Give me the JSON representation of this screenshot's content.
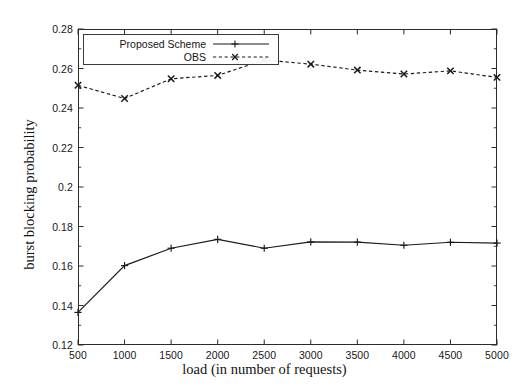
{
  "chart_data": {
    "type": "line",
    "title": "",
    "xlabel": "load (in number of requests)",
    "ylabel": "burst blocking probability",
    "x": [
      500,
      1000,
      1500,
      2000,
      2500,
      3000,
      3500,
      4000,
      4500,
      5000
    ],
    "xlim": [
      500,
      5000
    ],
    "ylim": [
      0.12,
      0.28
    ],
    "xticks": [
      "500",
      "1000",
      "1500",
      "2000",
      "2500",
      "3000",
      "3500",
      "4000",
      "4500",
      "5000"
    ],
    "yticks": [
      "0.28",
      "0.26",
      "0.24",
      "0.22",
      "0.2",
      "0.18",
      "0.16",
      "0.14",
      "0.12"
    ],
    "grid": false,
    "legend_position": "upper-left",
    "series": [
      {
        "name": "Proposed Scheme",
        "linestyle": "solid",
        "marker": "plus",
        "color": "#1a1a1a",
        "values": [
          0.1365,
          0.1602,
          0.169,
          0.1735,
          0.169,
          0.1722,
          0.1721,
          0.1705,
          0.172,
          0.1716
        ]
      },
      {
        "name": "OBS",
        "linestyle": "dashed",
        "marker": "x",
        "color": "#1a1a1a",
        "values": [
          0.2515,
          0.2448,
          0.2548,
          0.2565,
          0.2643,
          0.2622,
          0.2592,
          0.2572,
          0.2588,
          0.2555
        ]
      }
    ]
  },
  "legend": {
    "entries": [
      {
        "label": "Proposed Scheme"
      },
      {
        "label": "OBS"
      }
    ]
  }
}
